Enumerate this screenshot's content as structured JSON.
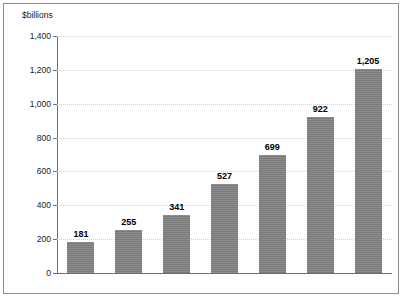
{
  "chart_data": {
    "type": "bar",
    "title": "",
    "subtitle": "",
    "xlabel": "",
    "ylabel": "$billions",
    "categories": [
      "2002",
      "2003",
      "2004",
      "2005",
      "2006",
      "2007",
      "2008"
    ],
    "values": [
      181,
      255,
      341,
      527,
      699,
      922,
      1205
    ],
    "data_labels": [
      "181",
      "255",
      "341",
      "527",
      "699",
      "922",
      "1,205"
    ],
    "ylim": [
      0,
      1400
    ],
    "ytick_values": [
      0,
      200,
      400,
      600,
      800,
      1000,
      1200,
      1400
    ],
    "ytick_labels": [
      "0",
      "200",
      "400",
      "600",
      "800",
      "1,000",
      "1,200",
      "1,400"
    ],
    "grid": "horizontal-dotted",
    "legend": "none",
    "bar_color": "#808080",
    "gridline_color": "#cfcfcf",
    "axis_color": "#6f6f6f",
    "label_color": "#000000",
    "border_color": "#8d8d8d",
    "background": "#ffffff"
  }
}
